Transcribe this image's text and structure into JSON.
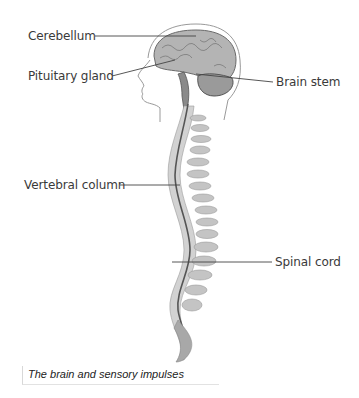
{
  "diagram": {
    "labels": [
      {
        "id": "cerebellum",
        "text": "Cerebellum"
      },
      {
        "id": "pituitary",
        "text": "Pituitary gland"
      },
      {
        "id": "brainstem",
        "text": "Brain stem"
      },
      {
        "id": "vertebral",
        "text": "Vertebral column"
      },
      {
        "id": "spinalcord",
        "text": "Spinal cord"
      }
    ],
    "caption": "The brain and sensory impulses",
    "colors": {
      "outline": "#9a9a9a",
      "brain_fill": "#a8a8a8",
      "vertebra_fill": "#cfcfcf",
      "cord": "#555555",
      "leader": "#444444"
    }
  }
}
